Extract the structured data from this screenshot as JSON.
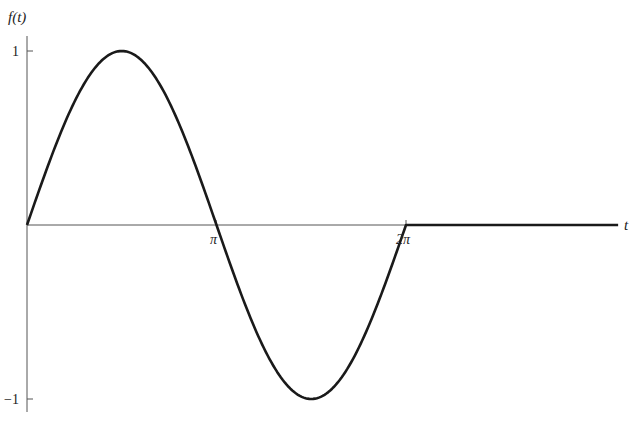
{
  "chart_data": {
    "type": "line",
    "title": "",
    "xlabel": "t",
    "ylabel": "f(t)",
    "x_ticks": [
      {
        "value": 3.14159,
        "label": "π"
      },
      {
        "value": 6.28319,
        "label": "2π"
      }
    ],
    "y_ticks": [
      {
        "value": 1,
        "label": "1"
      },
      {
        "value": -1,
        "label": "−1"
      }
    ],
    "xlim": [
      0,
      9.8
    ],
    "ylim": [
      -1,
      1
    ],
    "grid": false,
    "legend": null,
    "series": [
      {
        "name": "f(t)",
        "segments": [
          {
            "expr": "sin(t)",
            "t_start": 0,
            "t_end": 6.28319
          },
          {
            "expr": "0",
            "t_start": 6.28319,
            "t_end": 9.8
          }
        ],
        "x": [
          0,
          0.785,
          1.571,
          2.356,
          3.142,
          3.927,
          4.712,
          5.498,
          6.283,
          9.8
        ],
        "values": [
          0,
          0.707,
          1,
          0.707,
          0,
          -0.707,
          -1,
          -0.707,
          0,
          0
        ]
      }
    ],
    "colors": {
      "curve": "#1a1a1a",
      "axes": "#555555",
      "background": "#ffffff"
    }
  }
}
